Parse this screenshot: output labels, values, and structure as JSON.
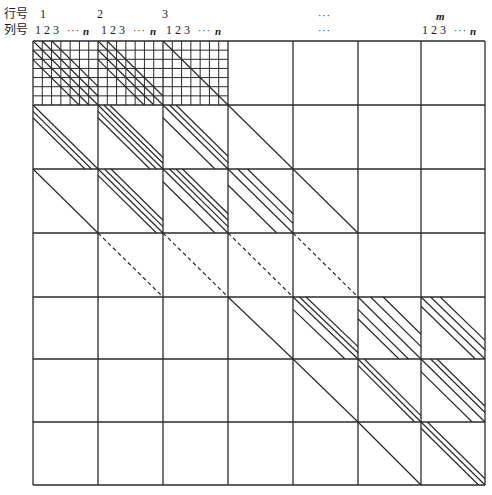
{
  "labels": {
    "row_header": "行号",
    "col_header": "列号",
    "row_numbers": [
      "1",
      "2",
      "3",
      "…",
      "m"
    ],
    "col_sequence": "1 2 3",
    "col_ellipsis": "···",
    "col_last": "n",
    "middle_ellipsis_row": "···",
    "middle_ellipsis_col": "···"
  },
  "style": {
    "line_color": "#2a2a2a",
    "background": "#ffffff"
  },
  "grid": {
    "x_lines": [
      33,
      98,
      163,
      228,
      293,
      358,
      421,
      485
    ],
    "y_lines": [
      41,
      105,
      169,
      233,
      297,
      359,
      422,
      485
    ],
    "subgrid_blocks": [
      [
        0,
        0
      ],
      [
        0,
        1
      ],
      [
        0,
        2
      ]
    ],
    "subgrid_divisions": 7
  },
  "blocks": [
    {
      "r": 0,
      "c": 0,
      "diags": [
        0.29,
        0.14,
        0,
        -0.14,
        -0.29
      ],
      "style": "solid"
    },
    {
      "r": 0,
      "c": 1,
      "diags": [
        0.14,
        0,
        -0.14,
        -0.29
      ],
      "style": "solid"
    },
    {
      "r": 0,
      "c": 2,
      "diags": [
        0
      ],
      "style": "solid"
    },
    {
      "r": 1,
      "c": 0,
      "diags": [
        0,
        -0.1,
        -0.2
      ],
      "style": "solid"
    },
    {
      "r": 1,
      "c": 1,
      "diags": [
        0.18,
        0.09,
        0,
        -0.1,
        -0.2
      ],
      "style": "solid"
    },
    {
      "r": 1,
      "c": 2,
      "diags": [
        0.2,
        0.1,
        0,
        -0.2
      ],
      "style": "solid"
    },
    {
      "r": 1,
      "c": 3,
      "diags": [
        0
      ],
      "style": "solid"
    },
    {
      "r": 2,
      "c": 0,
      "diags": [
        0
      ],
      "style": "solid"
    },
    {
      "r": 2,
      "c": 1,
      "diags": [
        0.2,
        0.1,
        0,
        -0.1
      ],
      "style": "solid"
    },
    {
      "r": 2,
      "c": 2,
      "diags": [
        0.3,
        0.2,
        0.1,
        0,
        -0.2
      ],
      "style": "solid"
    },
    {
      "r": 2,
      "c": 3,
      "diags": [
        0.3,
        0.15,
        0,
        -0.25
      ],
      "style": "solid"
    },
    {
      "r": 2,
      "c": 4,
      "diags": [
        0
      ],
      "style": "solid"
    },
    {
      "r": 3,
      "c": 1,
      "diags": [
        0
      ],
      "style": "dashed"
    },
    {
      "r": 3,
      "c": 2,
      "diags": [
        0
      ],
      "style": "dashed"
    },
    {
      "r": 3,
      "c": 3,
      "diags": [
        0
      ],
      "style": "dashed"
    },
    {
      "r": 3,
      "c": 4,
      "diags": [
        0
      ],
      "style": "dashed"
    },
    {
      "r": 4,
      "c": 3,
      "diags": [
        0
      ],
      "style": "solid"
    },
    {
      "r": 4,
      "c": 4,
      "diags": [
        0.2,
        0.1,
        0,
        -0.2
      ],
      "style": "solid"
    },
    {
      "r": 4,
      "c": 5,
      "diags": [
        0.4,
        0.2,
        0,
        -0.2,
        -0.35
      ],
      "style": "solid"
    },
    {
      "r": 4,
      "c": 6,
      "diags": [
        0.3,
        0.15,
        0,
        -0.15
      ],
      "style": "solid"
    },
    {
      "r": 4,
      "c": 7,
      "diags": [
        0
      ],
      "style": "solid"
    },
    {
      "r": 5,
      "c": 4,
      "diags": [
        0
      ],
      "style": "solid"
    },
    {
      "r": 5,
      "c": 5,
      "diags": [
        0.1,
        0,
        -0.1
      ],
      "style": "solid"
    },
    {
      "r": 5,
      "c": 6,
      "diags": [
        0.25,
        0.15,
        0,
        -0.2
      ],
      "style": "solid"
    },
    {
      "r": 5,
      "c": 7,
      "diags": [
        0.3,
        0.15,
        0,
        -0.15
      ],
      "style": "solid"
    },
    {
      "r": 6,
      "c": 5,
      "diags": [
        0
      ],
      "style": "solid"
    },
    {
      "r": 6,
      "c": 6,
      "diags": [
        0.1,
        0,
        -0.1
      ],
      "style": "solid"
    },
    {
      "r": 6,
      "c": 7,
      "diags": [
        0.35,
        0.25,
        0.1,
        0,
        -0.15,
        -0.3
      ],
      "style": "solid"
    }
  ]
}
